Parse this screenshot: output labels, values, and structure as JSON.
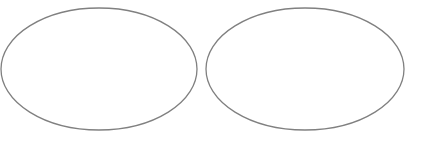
{
  "canvas": {
    "width": 421,
    "height": 143,
    "background": "#ffffff"
  },
  "shapes": [
    {
      "type": "ellipse",
      "label": "",
      "x": 1,
      "y": 8,
      "width": 196,
      "height": 122,
      "stroke": "#808080",
      "stroke_width": 1.3,
      "fill": "none"
    },
    {
      "type": "ellipse",
      "label": "",
      "x": 206,
      "y": 8,
      "width": 198,
      "height": 122,
      "stroke": "#808080",
      "stroke_width": 1.3,
      "fill": "none"
    }
  ]
}
